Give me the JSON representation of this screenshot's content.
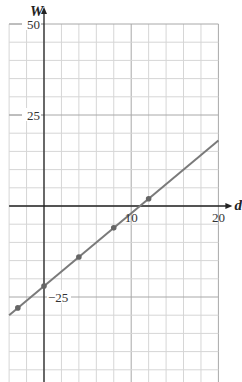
{
  "chart_data": {
    "type": "line",
    "title": "",
    "xlabel": "d",
    "ylabel": "W",
    "xlim": [
      -4,
      20
    ],
    "ylim": [
      -48,
      50
    ],
    "x_grid_step": 2,
    "y_grid_step": 5,
    "grid": true,
    "x_tick_labels": [
      {
        "value": 10,
        "label": "10"
      },
      {
        "value": 20,
        "label": "20"
      }
    ],
    "y_tick_labels": [
      {
        "value": 50,
        "label": "50"
      },
      {
        "value": 25,
        "label": "25"
      },
      {
        "value": -25,
        "label": "−25"
      }
    ],
    "series": [
      {
        "name": "W = 2d − 22",
        "line": {
          "x": [
            -4,
            20
          ],
          "y": [
            -30,
            18
          ]
        },
        "points": {
          "x": [
            -3,
            0,
            4,
            8,
            12
          ],
          "y": [
            -28,
            -22,
            -14,
            -6,
            2
          ]
        }
      }
    ],
    "colors": {
      "line": "#7a7a7a",
      "points": "#666666",
      "grid": "#d6d6d6",
      "axis": "#222222"
    }
  }
}
